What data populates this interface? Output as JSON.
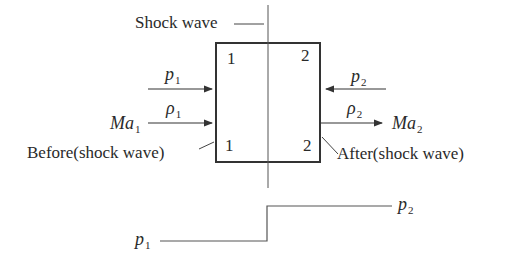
{
  "title_label": "Shock wave",
  "region_before": {
    "top_num": "1",
    "bottom_num": "1",
    "caption": "Before(shock wave)",
    "pressure": {
      "sym": "p",
      "sub": "1"
    },
    "density": {
      "sym": "ρ",
      "sub": "1"
    },
    "mach": {
      "sym": "Ma",
      "sub": "1"
    }
  },
  "region_after": {
    "top_num": "2",
    "bottom_num": "2",
    "caption": "After(shock wave)",
    "pressure": {
      "sym": "p",
      "sub": "2"
    },
    "density": {
      "sym": "ρ",
      "sub": "2"
    },
    "mach": {
      "sym": "Ma",
      "sub": "2"
    }
  },
  "pressure_profile": {
    "low_label": {
      "sym": "p",
      "sub": "1"
    },
    "high_label": {
      "sym": "p",
      "sub": "2"
    }
  },
  "colors": {
    "line": "#333333",
    "text": "#2a2a2a"
  }
}
